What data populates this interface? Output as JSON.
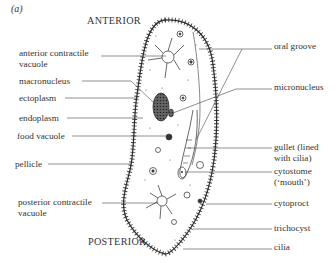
{
  "figure_label": "(a)",
  "orientation": {
    "top": "ANTERIOR",
    "bottom": "POSTERIOR"
  },
  "labels_left": [
    {
      "line1": "anterior contractile",
      "line2": "vacuole"
    },
    {
      "line1": "macronucleus"
    },
    {
      "line1": "ectoplasm"
    },
    {
      "line1": "endoplasm"
    },
    {
      "line1": "food vacuole"
    },
    {
      "line1": "pellicle"
    },
    {
      "line1": "posterior contractile",
      "line2": "vacuole"
    }
  ],
  "labels_right": [
    {
      "line1": "oral groove"
    },
    {
      "line1": "micronucleus"
    },
    {
      "line1": "gullet (lined",
      "line2": "with cilia)"
    },
    {
      "line1": "cytostome",
      "line2": "(‘mouth’)"
    },
    {
      "line1": "cytoproct"
    },
    {
      "line1": "trichocyst"
    },
    {
      "line1": "cilia"
    }
  ],
  "colors": {
    "ink": "#333333",
    "background": "#ffffff"
  }
}
